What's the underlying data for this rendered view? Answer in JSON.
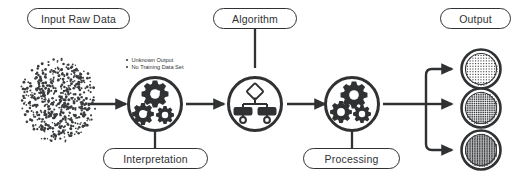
{
  "diagram": {
    "title_nodes": {
      "input": "Input Raw Data",
      "algorithm": "Algorithm",
      "output": "Output",
      "interpretation": "Interpretation",
      "processing": "Processing"
    },
    "annotations": [
      "Unknown Output",
      "No Training Data Set"
    ],
    "colors": {
      "stroke": "#2f3133",
      "background": "#ffffff",
      "dots": "#3a3c3e"
    },
    "nodes": [
      {
        "id": "raw-data-scatter",
        "label": "Input Raw Data",
        "icon": "scatter-cloud-icon"
      },
      {
        "id": "interpretation",
        "label": "Interpretation",
        "icon": "gears-check-question-icon"
      },
      {
        "id": "algorithm",
        "label": "Algorithm",
        "icon": "decision-tree-icon"
      },
      {
        "id": "processing",
        "label": "Processing",
        "icon": "gears-icon"
      },
      {
        "id": "output-sparse",
        "label": "Output",
        "icon": "sparse-grid-icon"
      },
      {
        "id": "output-medium",
        "label": "Output",
        "icon": "medium-grid-icon"
      },
      {
        "id": "output-dense",
        "label": "Output",
        "icon": "dense-grid-icon"
      }
    ],
    "flow": [
      "raw-data-scatter -> interpretation",
      "interpretation -> algorithm",
      "algorithm -> processing",
      "processing -> output-sparse",
      "processing -> output-medium",
      "processing -> output-dense"
    ]
  }
}
